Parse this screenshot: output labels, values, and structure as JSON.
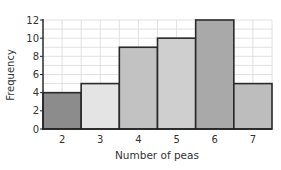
{
  "chart_data": {
    "type": "bar",
    "title": "",
    "xlabel": "Number of peas",
    "ylabel": "Frequency",
    "categories": [
      "2",
      "3",
      "4",
      "5",
      "6",
      "7"
    ],
    "values": [
      4,
      5,
      9,
      10,
      12,
      5
    ],
    "bar_colors": [
      "#8c8c8c",
      "#e4e4e4",
      "#c2c2c2",
      "#cfcfcf",
      "#a9a9a9",
      "#bdbdbd"
    ],
    "yticks": [
      0,
      2,
      4,
      6,
      8,
      10,
      12
    ],
    "ylim": [
      0,
      12
    ],
    "grid": true,
    "grid_color": "#d9d9d9",
    "legend": null,
    "bar_gap": 0,
    "histogram_style": true
  }
}
